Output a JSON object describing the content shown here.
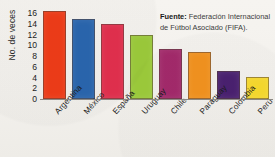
{
  "chart_data": {
    "type": "bar",
    "title": "",
    "xlabel": "",
    "ylabel": "No. de veces",
    "ylim": [
      0,
      17
    ],
    "ytick_step": 2,
    "yticks": [
      0,
      2,
      4,
      6,
      8,
      10,
      12,
      14,
      16
    ],
    "grid": false,
    "legend": "none",
    "categories": [
      "Argentina",
      "México",
      "España",
      "Uruguay",
      "Chile",
      "Paraguay",
      "Colombia",
      "Perú"
    ],
    "values": [
      16.5,
      15,
      14,
      12,
      9.3,
      8.8,
      5.3,
      4.2
    ],
    "colors": [
      "#ef3c18",
      "#2a66ae",
      "#e2304e",
      "#9ccb3b",
      "#a32a6b",
      "#f2921f",
      "#4a2170",
      "#f7d92e"
    ],
    "annotations": [
      {
        "name": "source-note",
        "label": "Fuente:",
        "text": "Federación Internacional de Fútbol Asociado (FIFA)."
      }
    ]
  },
  "source": {
    "label": "Fuente:",
    "text": " Federación Internacional de Fútbol Asociado (FIFA)."
  }
}
